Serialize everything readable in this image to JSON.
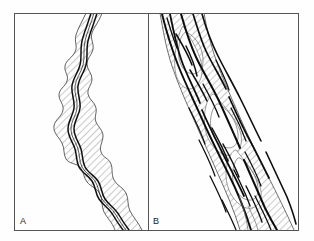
{
  "figure": {
    "background_color": "#fefefe",
    "line_color": "#111111",
    "frame_color": "#555555",
    "hatch_color": "#777777",
    "panels": [
      {
        "id": "A",
        "label": "A",
        "name": "meandering-channel-panel",
        "description": "Single sinuous meandering channel within an irregular hatched floodplain belt trending from upper-left to lower-right",
        "channel_count": 1,
        "pattern": "meandering"
      },
      {
        "id": "B",
        "label": "B",
        "name": "braided-channel-panel",
        "description": "Multiple anastomosing braided channels separated by hatched mid-channel bars trending from upper-left to lower-right",
        "channel_count": 7,
        "pattern": "braided"
      }
    ]
  }
}
